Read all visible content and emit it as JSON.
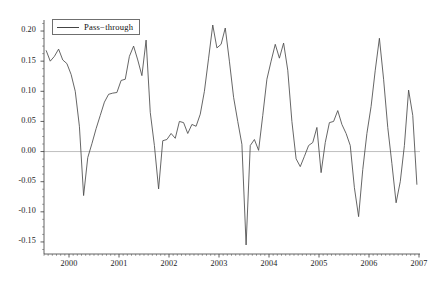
{
  "chart_data": {
    "type": "line",
    "title": "",
    "xlabel": "",
    "ylabel": "",
    "xlim": [
      1999.5,
      2007.0
    ],
    "ylim": [
      -0.17,
      0.215
    ],
    "grid": false,
    "zero_line": true,
    "zero_line_color": "#b8b8b8",
    "line_color": "#4a4a4a",
    "legend": {
      "position": "top-left",
      "boxed": true,
      "entries": [
        {
          "name": "Pass−through",
          "color": "#4a4a4a"
        }
      ]
    },
    "ytick_labels": [
      "0.20",
      "0.15",
      "0.10",
      "0.05",
      "0.00",
      "-0.05",
      "-0.10",
      "-0.15"
    ],
    "ytick_values": [
      0.2,
      0.15,
      0.1,
      0.05,
      0.0,
      -0.05,
      -0.1,
      -0.15
    ],
    "yminor_step": 0.0125,
    "xtick_labels": [
      "2000",
      "2001",
      "2002",
      "2003",
      "2004",
      "2005",
      "2006",
      "2007"
    ],
    "xtick_values": [
      2000,
      2001,
      2002,
      2003,
      2004,
      2005,
      2006,
      2007
    ],
    "xminor_step": 0.08333,
    "series": [
      {
        "name": "Pass−through",
        "color": "#4a4a4a",
        "x": [
          1999.542,
          1999.625,
          1999.708,
          1999.792,
          1999.875,
          1999.958,
          2000.042,
          2000.125,
          2000.208,
          2000.292,
          2000.375,
          2000.458,
          2000.542,
          2000.625,
          2000.708,
          2000.792,
          2000.875,
          2000.958,
          2001.042,
          2001.125,
          2001.208,
          2001.292,
          2001.375,
          2001.458,
          2001.542,
          2001.625,
          2001.708,
          2001.792,
          2001.875,
          2001.958,
          2002.042,
          2002.125,
          2002.208,
          2002.292,
          2002.375,
          2002.458,
          2002.542,
          2002.625,
          2002.708,
          2002.792,
          2002.875,
          2002.958,
          2003.042,
          2003.125,
          2003.208,
          2003.292,
          2003.375,
          2003.458,
          2003.542,
          2003.625,
          2003.708,
          2003.792,
          2003.875,
          2003.958,
          2004.042,
          2004.125,
          2004.208,
          2004.292,
          2004.375,
          2004.458,
          2004.542,
          2004.625,
          2004.708,
          2004.792,
          2004.875,
          2004.958,
          2005.042,
          2005.125,
          2005.208,
          2005.292,
          2005.375,
          2005.458,
          2005.542,
          2005.625,
          2005.708,
          2005.792,
          2005.875,
          2005.958,
          2006.042,
          2006.125,
          2006.208,
          2006.292,
          2006.375,
          2006.458,
          2006.542,
          2006.625,
          2006.708,
          2006.792,
          2006.875,
          2006.958
        ],
        "y": [
          0.168,
          0.15,
          0.158,
          0.17,
          0.152,
          0.146,
          0.128,
          0.1,
          0.042,
          -0.073,
          -0.01,
          0.013,
          0.038,
          0.06,
          0.082,
          0.095,
          0.097,
          0.098,
          0.118,
          0.12,
          0.158,
          0.175,
          0.152,
          0.126,
          0.185,
          0.065,
          0.01,
          -0.062,
          0.018,
          0.02,
          0.03,
          0.022,
          0.05,
          0.048,
          0.03,
          0.045,
          0.042,
          0.062,
          0.1,
          0.155,
          0.21,
          0.172,
          0.178,
          0.205,
          0.15,
          0.09,
          0.05,
          0.012,
          -0.155,
          0.01,
          0.02,
          0.002,
          0.06,
          0.12,
          0.15,
          0.178,
          0.155,
          0.18,
          0.135,
          0.05,
          -0.012,
          -0.025,
          -0.008,
          0.01,
          0.015,
          0.04,
          -0.035,
          0.015,
          0.048,
          0.05,
          0.068,
          0.045,
          0.03,
          0.01,
          -0.06,
          -0.108,
          -0.03,
          0.03,
          0.075,
          0.135,
          0.188,
          0.12,
          0.04,
          -0.02,
          -0.085,
          -0.05,
          0.01,
          0.102,
          0.06,
          -0.055
        ]
      }
    ]
  }
}
